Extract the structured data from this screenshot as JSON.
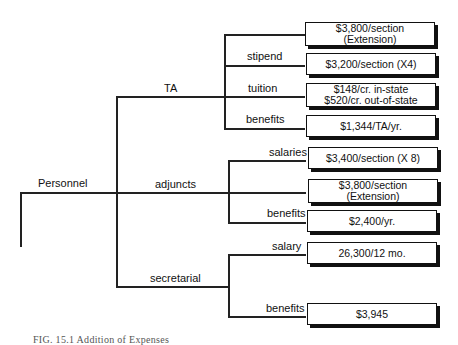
{
  "diagram": {
    "root": {
      "label": "Personnel"
    },
    "branches": [
      {
        "label": "TA",
        "children": [
          {
            "label": "",
            "value_lines": [
              "$3,800/section",
              "(Extension)"
            ]
          },
          {
            "label": "stipend",
            "value_lines": [
              "$3,200/section (X4)"
            ]
          },
          {
            "label": "tuition",
            "value_lines": [
              "$148/cr. in-state",
              "$520/cr. out-of-state"
            ]
          },
          {
            "label": "benefits",
            "value_lines": [
              "$1,344/TA/yr."
            ]
          }
        ]
      },
      {
        "label": "adjuncts",
        "children": [
          {
            "label": "salaries",
            "value_lines": [
              "$3,400/section (X 8)"
            ]
          },
          {
            "label": "",
            "value_lines": [
              "$3,800/section",
              "(Extension)"
            ]
          },
          {
            "label": "benefits",
            "value_lines": [
              "$2,400/yr."
            ]
          }
        ]
      },
      {
        "label": "secretarial",
        "children": [
          {
            "label": "salary",
            "value_lines": [
              "26,300/12 mo."
            ]
          },
          {
            "label": "benefits",
            "value_lines": [
              "$3,945"
            ]
          }
        ]
      }
    ],
    "caption": "FIG. 15.1   Addition of Expenses"
  },
  "colors": {
    "line": "#222222",
    "box_border": "#111111",
    "box_shadow": "#111111",
    "background": "#ffffff"
  }
}
